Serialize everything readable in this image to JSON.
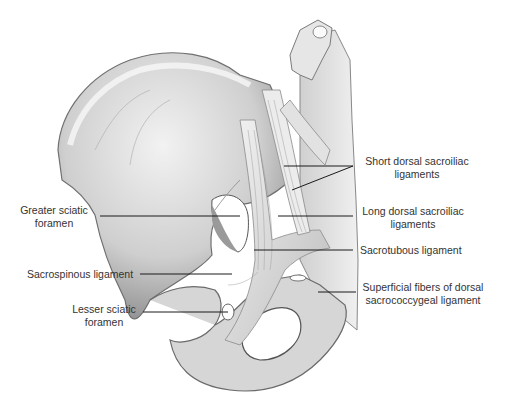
{
  "figure": {
    "background": "#ffffff",
    "colors": {
      "bone_light": "#e8e8e8",
      "bone_mid": "#bdbdbd",
      "bone_dark": "#6e6e6e",
      "line": "#1a1a1a",
      "text": "#333333"
    }
  },
  "labels": {
    "greater_sciatic_1": "Greater sciatic",
    "greater_sciatic_2": "foramen",
    "sacrospinous": "Sacrospinous ligament",
    "lesser_sciatic_1": "Lesser sciatic",
    "lesser_sciatic_2": "foramen",
    "short_dorsal_1": "Short dorsal sacroiliac",
    "short_dorsal_2": "ligaments",
    "long_dorsal_1": "Long dorsal sacroiliac",
    "long_dorsal_2": "ligaments",
    "sacrotuberous": "Sacrotubous ligament",
    "superficial_1": "Superficial fibers of dorsal",
    "superficial_2": "sacrococcygeal ligament"
  }
}
